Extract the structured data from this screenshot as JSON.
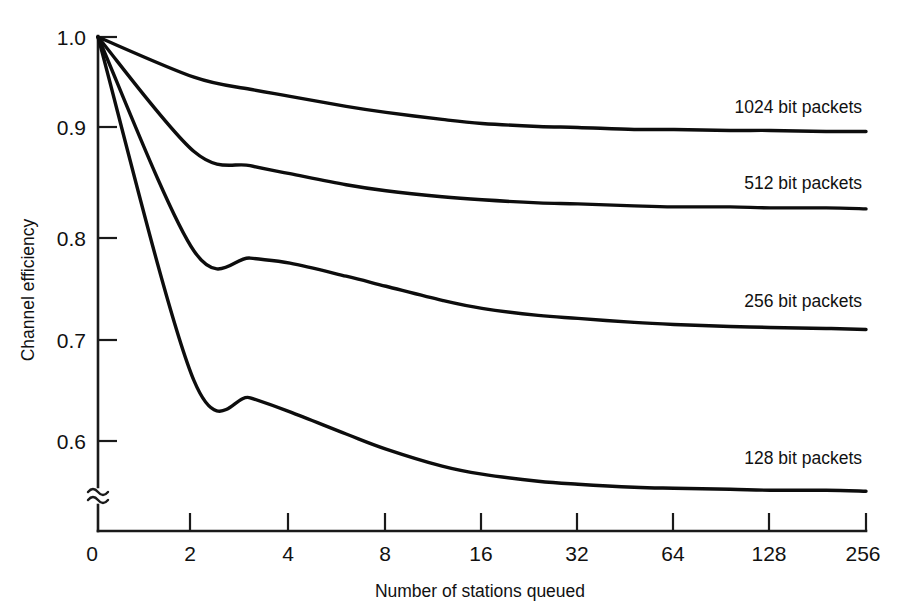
{
  "chart_data": {
    "type": "line",
    "title": "",
    "subtitle": "",
    "xlabel": "Number of stations queued",
    "ylabel": "Channel efficiency",
    "x_scale": "log2",
    "x_tick_labels": [
      "0",
      "2",
      "4",
      "8",
      "16",
      "32",
      "64",
      "128",
      "256"
    ],
    "x_tick_values": [
      0,
      2,
      4,
      8,
      16,
      32,
      64,
      128,
      256
    ],
    "y_tick_labels": [
      "0",
      "0.6",
      "0.7",
      "0.8",
      "0.9",
      "1.0"
    ],
    "y_tick_values": [
      0,
      0.6,
      0.7,
      0.8,
      0.9,
      1.0
    ],
    "ylim": [
      0.55,
      1.0
    ],
    "xlim": [
      1,
      256
    ],
    "y_axis_break": true,
    "y_axis_break_symbol": "≈",
    "grid": false,
    "legend_position": "inline-right-of-curve",
    "x": [
      1,
      2,
      3,
      4,
      6,
      8,
      12,
      16,
      24,
      32,
      48,
      64,
      96,
      128,
      192,
      256
    ],
    "series": [
      {
        "name": "1024 bit packets",
        "label": "1024 bit packets",
        "color": "#0d0d0d",
        "values": [
          1.0,
          0.96,
          0.948,
          0.941,
          0.931,
          0.925,
          0.918,
          0.914,
          0.911,
          0.91,
          0.908,
          0.908,
          0.907,
          0.907,
          0.906,
          0.906
        ]
      },
      {
        "name": "512 bit packets",
        "label": "512 bit packets",
        "color": "#0d0d0d",
        "values": [
          1.0,
          0.886,
          0.872,
          0.864,
          0.853,
          0.847,
          0.841,
          0.838,
          0.835,
          0.834,
          0.832,
          0.831,
          0.831,
          0.83,
          0.83,
          0.829
        ]
      },
      {
        "name": "256 bit packets",
        "label": "256 bit packets",
        "color": "#0d0d0d",
        "values": [
          1.0,
          0.787,
          0.78,
          0.775,
          0.762,
          0.752,
          0.738,
          0.73,
          0.723,
          0.72,
          0.716,
          0.714,
          0.712,
          0.711,
          0.71,
          0.709
        ]
      },
      {
        "name": "128 bit packets",
        "label": "128 bit packets",
        "color": "#0d0d0d",
        "values": [
          1.0,
          0.658,
          0.641,
          0.627,
          0.605,
          0.59,
          0.573,
          0.565,
          0.558,
          0.555,
          0.552,
          0.551,
          0.55,
          0.549,
          0.549,
          0.548
        ]
      }
    ],
    "annotations": [
      {
        "text": "1024 bit packets",
        "near_series": "1024 bit packets",
        "position": "above-right-end"
      },
      {
        "text": "512 bit packets",
        "near_series": "512 bit packets",
        "position": "above-right-end"
      },
      {
        "text": "256 bit packets",
        "near_series": "256 bit packets",
        "position": "above-right-end"
      },
      {
        "text": "128 bit packets",
        "near_series": "128 bit packets",
        "position": "above-right-end"
      }
    ]
  },
  "axes": {
    "y_title": "Channel efficiency",
    "x_title": "Number of stations queued",
    "y_labels": {
      "t0": "1.0",
      "t1": "0.9",
      "t2": "0.8",
      "t3": "0.7",
      "t4": "0.6",
      "origin": "0"
    },
    "x_labels": {
      "t0": "0",
      "t1": "2",
      "t2": "4",
      "t3": "8",
      "t4": "16",
      "t5": "32",
      "t6": "64",
      "t7": "128",
      "t8": "256"
    },
    "break_symbol": "≈"
  },
  "series_labels": {
    "s1024": "1024 bit packets",
    "s512": "512 bit packets",
    "s256": "256 bit packets",
    "s128": "128 bit packets"
  },
  "colors": {
    "background": "#ffffff",
    "ink": "#111111",
    "curve": "#0d0d0d"
  }
}
